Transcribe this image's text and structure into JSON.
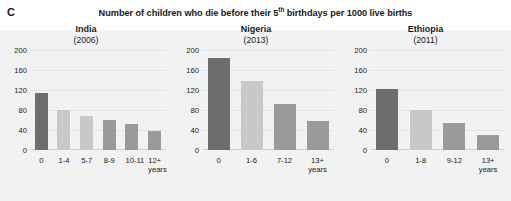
{
  "figure": {
    "panel_letter": "C",
    "title_before": "Number of children who die before their 5",
    "title_sup": "th",
    "title_after": " birthdays per 1000 live births"
  },
  "colors": {
    "bar_dark": "#6e6e6e",
    "bar_light": "#c8c8c8",
    "bar_medium": "#9a9a9a",
    "gridline": "#e3e3e3",
    "backdrop": "#f2f2f2"
  },
  "chart_data": [
    {
      "type": "bar",
      "title": "India",
      "subtitle": "(2006)",
      "xlabel": "years",
      "ylabel": "",
      "ylim": [
        0,
        200
      ],
      "yticks": [
        "0",
        "40",
        "80",
        "120",
        "160",
        "200"
      ],
      "grid": true,
      "categories": [
        "0",
        "1-4",
        "5-7",
        "8-9",
        "10-11",
        "12+"
      ],
      "unit_suffix": "years",
      "values": [
        115,
        81,
        68,
        60,
        53,
        38
      ],
      "bar_colors": [
        "#6e6e6e",
        "#c8c8c8",
        "#c8c8c8",
        "#9a9a9a",
        "#9a9a9a",
        "#9a9a9a"
      ]
    },
    {
      "type": "bar",
      "title": "Nigeria",
      "subtitle": "(2013)",
      "xlabel": "years",
      "ylabel": "",
      "ylim": [
        0,
        200
      ],
      "yticks": [
        "0",
        "40",
        "80",
        "120",
        "160",
        "200"
      ],
      "grid": true,
      "categories": [
        "0",
        "1-6",
        "7-12",
        "13+"
      ],
      "unit_suffix": "years",
      "values": [
        185,
        138,
        93,
        58
      ],
      "bar_colors": [
        "#6e6e6e",
        "#c8c8c8",
        "#9a9a9a",
        "#9a9a9a"
      ]
    },
    {
      "type": "bar",
      "title": "Ethiopia",
      "subtitle": "(2011)",
      "xlabel": "years",
      "ylabel": "",
      "ylim": [
        0,
        200
      ],
      "yticks": [
        "0",
        "40",
        "80",
        "120",
        "160",
        "200"
      ],
      "grid": true,
      "categories": [
        "0",
        "1-8",
        "9-12",
        "13+"
      ],
      "unit_suffix": "years",
      "values": [
        122,
        80,
        55,
        30
      ],
      "bar_colors": [
        "#6e6e6e",
        "#c8c8c8",
        "#9a9a9a",
        "#9a9a9a"
      ]
    }
  ]
}
